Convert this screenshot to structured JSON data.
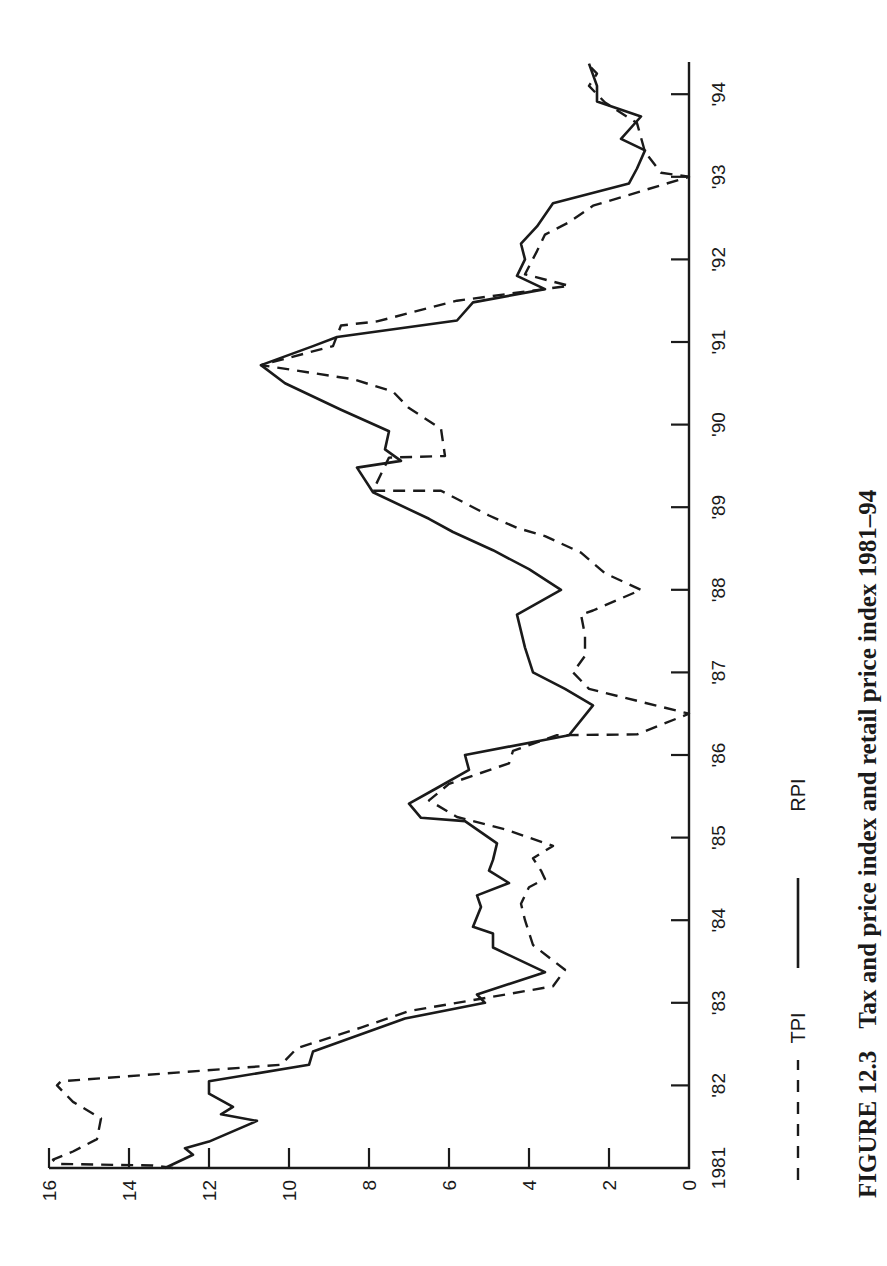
{
  "figure": {
    "number": "FIGURE 12.3",
    "title": "Tax and price index and retail price index 1981–94"
  },
  "legend": {
    "items": [
      {
        "label": "TPI",
        "style": "dashed"
      },
      {
        "label": "RPI",
        "style": "solid"
      }
    ]
  },
  "axes": {
    "value_ticks": [
      "0",
      "2",
      "4",
      "6",
      "8",
      "10",
      "12",
      "14",
      "16"
    ],
    "time_ticks": [
      "1981",
      "'82",
      "'83",
      "'84",
      "'85",
      "'86",
      "'87",
      "'88",
      "'89",
      "'90",
      "'91",
      "'92",
      "'93",
      "'94"
    ]
  },
  "chart_data": {
    "type": "line",
    "title": "Tax and price index and retail price index 1981–94",
    "xlabel": "",
    "ylabel": "",
    "orientation": "rotated 90° counter-clockwise on page (time axis vertical, values horizontal)",
    "xlim": [
      1981,
      1994.4
    ],
    "ylim": [
      0,
      16
    ],
    "x_ticks": [
      "1981",
      "'82",
      "'83",
      "'84",
      "'85",
      "'86",
      "'87",
      "'88",
      "'89",
      "'90",
      "'91",
      "'92",
      "'93",
      "'94"
    ],
    "y_ticks": [
      0,
      2,
      4,
      6,
      8,
      10,
      12,
      14,
      16
    ],
    "grid": false,
    "legend_position": "below plot",
    "series": [
      {
        "name": "TPI",
        "style": "dashed",
        "points": [
          [
            1981.0,
            12.9
          ],
          [
            1981.03,
            13.4
          ],
          [
            1981.05,
            15.8
          ],
          [
            1981.1,
            15.9
          ],
          [
            1981.2,
            15.4
          ],
          [
            1981.35,
            14.8
          ],
          [
            1981.6,
            14.7
          ],
          [
            1981.8,
            15.4
          ],
          [
            1982.0,
            15.8
          ],
          [
            1982.05,
            15.7
          ],
          [
            1982.25,
            10.2
          ],
          [
            1982.45,
            9.8
          ],
          [
            1982.7,
            8.2
          ],
          [
            1982.9,
            7.0
          ],
          [
            1983.05,
            5.2
          ],
          [
            1983.2,
            3.4
          ],
          [
            1983.4,
            3.1
          ],
          [
            1983.7,
            3.9
          ],
          [
            1984.0,
            4.1
          ],
          [
            1984.2,
            4.2
          ],
          [
            1984.4,
            4.0
          ],
          [
            1984.5,
            3.6
          ],
          [
            1984.6,
            3.7
          ],
          [
            1984.75,
            3.9
          ],
          [
            1984.9,
            3.4
          ],
          [
            1985.1,
            4.6
          ],
          [
            1985.25,
            5.8
          ],
          [
            1985.45,
            6.5
          ],
          [
            1985.65,
            6.0
          ],
          [
            1985.9,
            4.5
          ],
          [
            1986.05,
            4.4
          ],
          [
            1986.24,
            3.3
          ],
          [
            1986.25,
            1.3
          ],
          [
            1986.5,
            0.0
          ],
          [
            1986.8,
            2.5
          ],
          [
            1987.0,
            2.9
          ],
          [
            1987.2,
            2.6
          ],
          [
            1987.45,
            2.6
          ],
          [
            1987.7,
            2.7
          ],
          [
            1987.75,
            2.4
          ],
          [
            1988.0,
            1.2
          ],
          [
            1988.2,
            2.1
          ],
          [
            1988.45,
            2.7
          ],
          [
            1988.65,
            3.6
          ],
          [
            1988.75,
            4.3
          ],
          [
            1988.9,
            5.0
          ],
          [
            1989.2,
            6.2
          ],
          [
            1989.2,
            7.9
          ],
          [
            1989.6,
            7.5
          ],
          [
            1989.62,
            6.1
          ],
          [
            1989.95,
            6.2
          ],
          [
            1990.2,
            7.0
          ],
          [
            1990.4,
            7.4
          ],
          [
            1990.55,
            8.4
          ],
          [
            1990.72,
            10.7
          ],
          [
            1990.95,
            8.9
          ],
          [
            1991.2,
            8.7
          ],
          [
            1991.25,
            7.8
          ],
          [
            1991.5,
            5.8
          ],
          [
            1991.68,
            3.0
          ],
          [
            1991.82,
            4.1
          ],
          [
            1992.1,
            3.8
          ],
          [
            1992.3,
            3.6
          ],
          [
            1992.45,
            3.0
          ],
          [
            1992.65,
            2.4
          ],
          [
            1993.0,
            0.0
          ],
          [
            1993.05,
            0.7
          ],
          [
            1993.3,
            1.1
          ],
          [
            1993.65,
            1.3
          ],
          [
            1993.9,
            2.1
          ],
          [
            1994.1,
            2.5
          ],
          [
            1994.25,
            2.3
          ],
          [
            1994.35,
            2.5
          ]
        ]
      },
      {
        "name": "RPI",
        "style": "solid",
        "points": [
          [
            1981.0,
            13.1
          ],
          [
            1981.16,
            12.4
          ],
          [
            1981.24,
            12.6
          ],
          [
            1981.32,
            12.0
          ],
          [
            1981.57,
            10.8
          ],
          [
            1981.65,
            11.7
          ],
          [
            1981.74,
            11.4
          ],
          [
            1981.9,
            12.0
          ],
          [
            1982.05,
            12.0
          ],
          [
            1982.25,
            9.5
          ],
          [
            1982.41,
            9.4
          ],
          [
            1982.81,
            7.1
          ],
          [
            1983.0,
            5.1
          ],
          [
            1983.1,
            5.3
          ],
          [
            1983.37,
            3.6
          ],
          [
            1983.67,
            4.9
          ],
          [
            1983.84,
            4.9
          ],
          [
            1983.92,
            5.4
          ],
          [
            1984.16,
            5.2
          ],
          [
            1984.3,
            5.3
          ],
          [
            1984.45,
            4.5
          ],
          [
            1984.6,
            5.0
          ],
          [
            1984.73,
            4.9
          ],
          [
            1984.93,
            4.8
          ],
          [
            1985.2,
            5.6
          ],
          [
            1985.24,
            6.7
          ],
          [
            1985.41,
            7.0
          ],
          [
            1985.6,
            6.3
          ],
          [
            1985.82,
            5.5
          ],
          [
            1986.0,
            5.6
          ],
          [
            1986.24,
            3.0
          ],
          [
            1986.6,
            2.4
          ],
          [
            1986.8,
            3.1
          ],
          [
            1987.0,
            3.9
          ],
          [
            1987.3,
            4.1
          ],
          [
            1987.7,
            4.3
          ],
          [
            1988.0,
            3.2
          ],
          [
            1988.25,
            4.0
          ],
          [
            1988.48,
            4.9
          ],
          [
            1988.7,
            5.9
          ],
          [
            1988.86,
            6.5
          ],
          [
            1989.18,
            7.9
          ],
          [
            1989.48,
            8.3
          ],
          [
            1989.56,
            7.2
          ],
          [
            1989.7,
            7.6
          ],
          [
            1989.92,
            7.5
          ],
          [
            1990.18,
            8.7
          ],
          [
            1990.5,
            10.1
          ],
          [
            1990.72,
            10.7
          ],
          [
            1990.95,
            9.4
          ],
          [
            1991.06,
            8.8
          ],
          [
            1991.26,
            5.8
          ],
          [
            1991.48,
            5.4
          ],
          [
            1991.64,
            3.6
          ],
          [
            1991.8,
            4.3
          ],
          [
            1992.0,
            4.1
          ],
          [
            1992.19,
            4.2
          ],
          [
            1992.4,
            3.8
          ],
          [
            1992.68,
            3.4
          ],
          [
            1992.92,
            1.5
          ],
          [
            1993.1,
            1.3
          ],
          [
            1993.32,
            1.1
          ],
          [
            1993.46,
            1.7
          ],
          [
            1993.73,
            1.2
          ],
          [
            1993.91,
            2.3
          ],
          [
            1994.1,
            2.3
          ],
          [
            1994.37,
            2.5
          ]
        ]
      }
    ]
  }
}
